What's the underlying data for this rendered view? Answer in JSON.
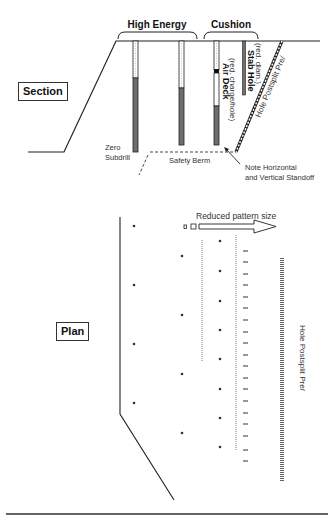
{
  "section": {
    "box_label": "Section",
    "brackets": {
      "high_energy": "High Energy",
      "cushion": "Cushion"
    },
    "labels": {
      "zero_subdrill_1": "Zero",
      "zero_subdrill_2": "Subdrill",
      "safety_berm": "Safety Berm",
      "air_deck": "Air Deck",
      "air_deck_note": "(red. charge/hole)",
      "stab_hole": "Stab Hole",
      "stab_hole_note": "(red. diam.)",
      "presplit": "Hole Postsplit Pre/",
      "standoff_1": "Note Horizontal",
      "standoff_2": "and Vertical Standoff"
    },
    "colors": {
      "charge": "#6e6e6e",
      "stemming": "#ffffff",
      "line": "#222222"
    }
  },
  "plan": {
    "box_label": "Plan",
    "arrow_label": "Reduced pattern size",
    "presplit_label": "Hole Postsplit Pre/"
  }
}
